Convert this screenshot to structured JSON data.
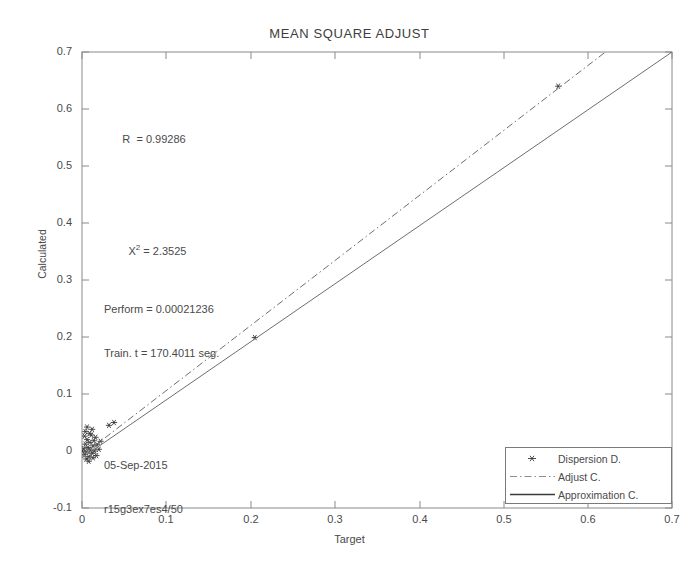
{
  "chart_data": {
    "type": "scatter",
    "title": "MEAN SQUARE ADJUST",
    "xlabel": "Target",
    "ylabel": "Calculated",
    "xlim": [
      0,
      0.7
    ],
    "ylim": [
      -0.1,
      0.7
    ],
    "xticks": [
      "0",
      "0.1",
      "0.2",
      "0.3",
      "0.4",
      "0.5",
      "0.6",
      "0.7"
    ],
    "xtick_values": [
      0,
      0.1,
      0.2,
      0.3,
      0.4,
      0.5,
      0.6,
      0.7
    ],
    "yticks": [
      "-0.1",
      "0",
      "0.1",
      "0.2",
      "0.3",
      "0.4",
      "0.5",
      "0.6",
      "0.7"
    ],
    "ytick_values": [
      -0.1,
      0,
      0.1,
      0.2,
      0.3,
      0.4,
      0.5,
      0.6,
      0.7
    ],
    "grid": false,
    "legend_position": "lower right",
    "series": [
      {
        "name": "Dispersion D.",
        "type": "scatter",
        "marker": "asterisk",
        "color": "#3a3a3a",
        "points": [
          [
            0.0,
            0.0
          ],
          [
            0.002,
            0.004
          ],
          [
            0.003,
            -0.006
          ],
          [
            0.004,
            0.012
          ],
          [
            0.005,
            -0.002
          ],
          [
            0.006,
            0.02
          ],
          [
            0.007,
            0.006
          ],
          [
            0.008,
            -0.01
          ],
          [
            0.009,
            0.015
          ],
          [
            0.01,
            0.002
          ],
          [
            0.011,
            0.028
          ],
          [
            0.012,
            -0.004
          ],
          [
            0.013,
            0.009
          ],
          [
            0.014,
            0.018
          ],
          [
            0.015,
            0.0
          ],
          [
            0.016,
            0.024
          ],
          [
            0.004,
            0.034
          ],
          [
            0.006,
            0.042
          ],
          [
            0.009,
            0.031
          ],
          [
            0.012,
            0.038
          ],
          [
            0.018,
            0.011
          ],
          [
            0.02,
            0.003
          ],
          [
            0.022,
            0.017
          ],
          [
            0.005,
            -0.014
          ],
          [
            0.008,
            -0.018
          ],
          [
            0.013,
            -0.012
          ],
          [
            0.017,
            -0.008
          ],
          [
            0.003,
            0.026
          ],
          [
            0.032,
            0.045
          ],
          [
            0.038,
            0.05
          ],
          [
            0.205,
            0.199
          ],
          [
            0.565,
            0.64
          ]
        ]
      },
      {
        "name": "Adjust C.",
        "type": "line",
        "style": "dash-dot",
        "color": "#6e6e6e",
        "points": [
          [
            0.0,
            -0.008
          ],
          [
            0.7,
            0.79
          ]
        ]
      },
      {
        "name": "Approximation C.",
        "type": "line",
        "style": "solid",
        "color": "#6e6e6e",
        "points": [
          [
            0.0,
            -0.012
          ],
          [
            0.7,
            0.7
          ]
        ]
      }
    ],
    "annotations": {
      "correlation_label": "R  = 0.99286",
      "chi_prefix": "X",
      "chi_exponent": "2",
      "chi_value": " = 2.3525",
      "perform": "Perform = 0.00021236",
      "train_time": "Train. t = 170.4011 seg.",
      "date": "05-Sep-2015",
      "run_id": "r15g3ex7es4/50"
    }
  },
  "legend": {
    "items": [
      {
        "label": "Dispersion D.",
        "marker": "asterisk-marker"
      },
      {
        "label": "Adjust C.",
        "marker": "dash-dot-line"
      },
      {
        "label": "Approximation C.",
        "marker": "solid-line"
      }
    ]
  }
}
